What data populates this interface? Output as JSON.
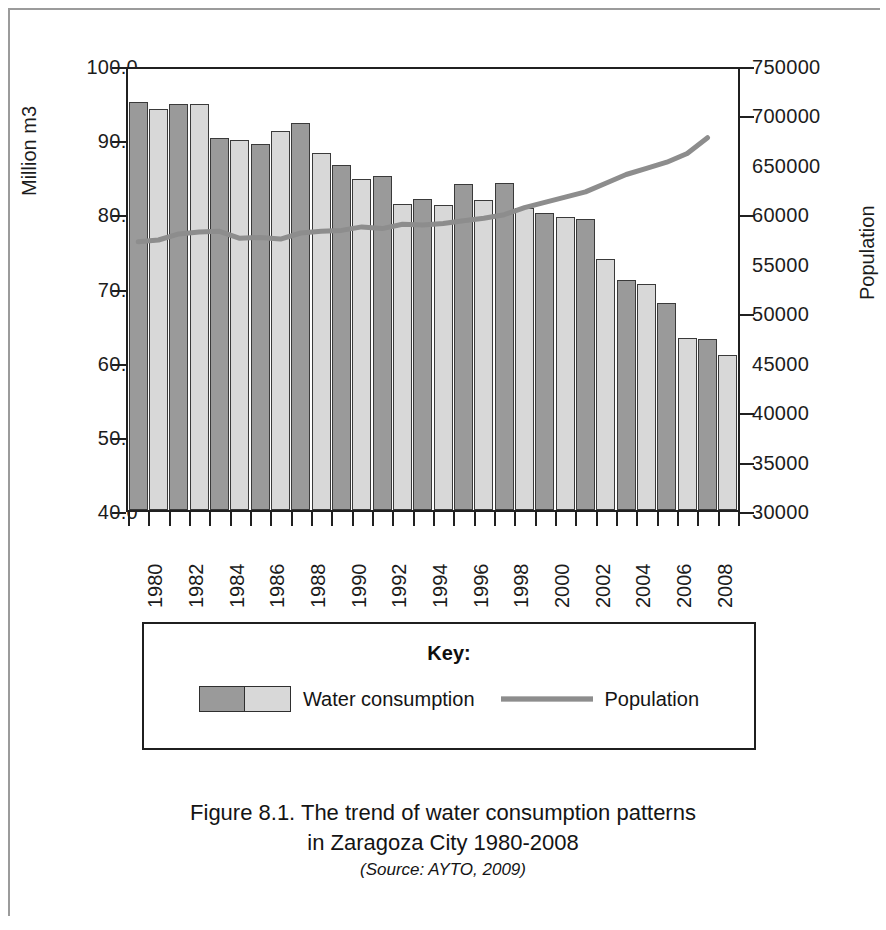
{
  "figure": {
    "caption_line1": "Figure 8.1. The trend of water consumption patterns",
    "caption_line2": "in Zaragoza City 1980-2008",
    "caption_source": "(Source: AYTO, 2009)"
  },
  "legend": {
    "title": "Key:",
    "entries": [
      {
        "label": "Water consumption",
        "marker": "bar-swatch",
        "color_dark": "#9a9a9a",
        "color_light": "#d8d8d8"
      },
      {
        "label": "Population",
        "marker": "line-swatch",
        "color": "#8d8d8d"
      }
    ]
  },
  "chart_data": {
    "type": "bar",
    "title": "",
    "xlabel": "",
    "ylabel": "Million m3",
    "y2label": "Population",
    "grid": false,
    "legend_position": "bottom",
    "ylim": [
      40.0,
      100.0
    ],
    "y2lim": [
      30000,
      750000
    ],
    "yticks": [
      "40.0",
      "50.0",
      "60.0",
      "70.0",
      "80.0",
      "90.0",
      "100.0"
    ],
    "ytick_values": [
      40.0,
      50.0,
      60.0,
      70.0,
      80.0,
      90.0,
      100.0
    ],
    "y2ticks": [
      "30000",
      "35000",
      "40000",
      "45000",
      "50000",
      "55000",
      "60000",
      "650000",
      "700000",
      "750000"
    ],
    "xtick_labels": [
      "1980",
      "1982",
      "1984",
      "1986",
      "1988",
      "1990",
      "1992",
      "1994",
      "1996",
      "1998",
      "2000",
      "2002",
      "2004",
      "2006",
      "2008"
    ],
    "categories": [
      "1980",
      "1981",
      "1982",
      "1983",
      "1984",
      "1985",
      "1986",
      "1987",
      "1988",
      "1989",
      "1990",
      "1991",
      "1992",
      "1993",
      "1994",
      "1995",
      "1996",
      "1997",
      "1998",
      "1999",
      "2000",
      "2001",
      "2002",
      "2003",
      "2004",
      "2005",
      "2006",
      "2007",
      "2008"
    ],
    "series": [
      {
        "name": "Water consumption",
        "type": "bar",
        "axis": "left",
        "units": "Million m3",
        "values": [
          95.5,
          94.5,
          95.3,
          95.3,
          90.6,
          90.3,
          89.8,
          91.6,
          92.6,
          88.6,
          87.0,
          85.1,
          85.4,
          81.6,
          82.3,
          81.5,
          84.3,
          82.2,
          84.5,
          81.1,
          80.4,
          79.9,
          79.6,
          74.2,
          71.3,
          70.7,
          68.1,
          63.4,
          63.2
        ]
      },
      {
        "name": "Population",
        "type": "line",
        "axis": "right",
        "values": [
          571000,
          573000,
          580000,
          582000,
          583000,
          575000,
          576000,
          574000,
          581000,
          583000,
          584000,
          588000,
          586000,
          591000,
          590000,
          592000,
          595000,
          598000,
          602000,
          610000,
          616000,
          622000,
          628000,
          638000,
          648000,
          655000,
          662000,
          672000,
          690000
        ]
      }
    ],
    "extra_bar_2008": 61.1
  }
}
